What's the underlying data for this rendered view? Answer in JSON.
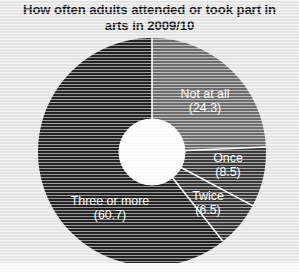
{
  "figure": {
    "title_line1": "How often adults attended or took part in",
    "title_line2": "arts in 2009/10",
    "background_color": "#e9e9e9",
    "title_color": "#19191c",
    "label_color": "#ffffff",
    "separator_color": "#ffffff",
    "hole_color": "#ffffff"
  },
  "chart_data": {
    "type": "pie",
    "title": "How often adults attended or took part in arts in 2009/10",
    "subtitle": "",
    "xlabel": "",
    "ylabel": "",
    "donut": true,
    "hole_ratio": 0.29,
    "start_angle_deg": 0,
    "direction": "clockwise",
    "legend": "none",
    "labels_inside": true,
    "units": "percent",
    "categories": [
      "Not at all",
      "Once",
      "Twice",
      "Three or more"
    ],
    "values": [
      24.3,
      8.5,
      6.5,
      60.7
    ],
    "value_labels": [
      "(24.3)",
      "(8.5)",
      "(6.5)",
      "(60.7)"
    ],
    "colors": [
      "#6e6e6e",
      "#3c3c3c",
      "#373737",
      "#242424"
    ],
    "slices": [
      {
        "label": "Not at all",
        "value": 24.3,
        "value_label": "(24.3)",
        "color": "#6e6e6e",
        "label_x": 205,
        "label_y": 98
      },
      {
        "label": "Once",
        "value": 8.5,
        "value_label": "(8.5)",
        "color": "#3c3c3c",
        "label_x": 228,
        "label_y": 162
      },
      {
        "label": "Twice",
        "value": 6.5,
        "value_label": "(6.5)",
        "color": "#373737",
        "label_x": 208,
        "label_y": 200
      },
      {
        "label": "Three or more",
        "value": 60.7,
        "value_label": "(60.7)",
        "color": "#242424",
        "label_x": 110,
        "label_y": 205
      }
    ]
  }
}
